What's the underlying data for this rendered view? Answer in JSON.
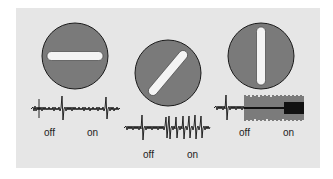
{
  "figure": {
    "panels": [
      {
        "orientation": "horizontal",
        "angle_deg": 0,
        "response": "weak",
        "labels": {
          "off": "off",
          "on": "on"
        }
      },
      {
        "orientation": "oblique",
        "angle_deg": 45,
        "response": "moderate",
        "labels": {
          "off": "off",
          "on": "on"
        }
      },
      {
        "orientation": "vertical",
        "angle_deg": 90,
        "response": "strong",
        "labels": {
          "off": "off",
          "on": "on"
        }
      }
    ]
  },
  "colors": {
    "background": "#ffffff",
    "panel": "#e6e6e6",
    "disc": "#7a7a7a",
    "disc_outline": "#1a1a1a",
    "bar": "#f4f4f4",
    "trace": "#111111"
  }
}
